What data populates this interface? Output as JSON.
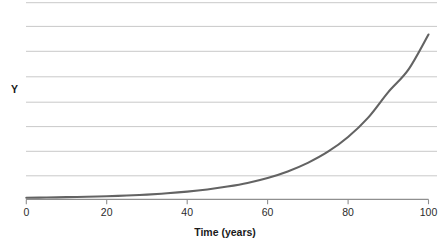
{
  "chart_data": {
    "type": "line",
    "title": "",
    "subtitle": "",
    "xlabel": "Time (years)",
    "ylabel": "Y",
    "xlim": [
      0,
      100
    ],
    "ylim": [
      0,
      9
    ],
    "grid": true,
    "grid_axis": "y",
    "legend": false,
    "legend_position": "none",
    "x_ticks": [
      0,
      20,
      40,
      60,
      80,
      100
    ],
    "x_tick_labels": [
      "0",
      "20",
      "40",
      "60",
      "80",
      "100"
    ],
    "y_ticks": [
      0,
      1,
      2,
      3,
      4,
      5,
      6,
      7,
      8,
      9
    ],
    "y_tick_labels": [
      "",
      "",
      "",
      "",
      "",
      "",
      "",
      "",
      "",
      ""
    ],
    "annotations": [],
    "series": [
      {
        "name": "Exponential growth",
        "color": "#636363",
        "line_width": 2.1,
        "x": [
          0,
          5,
          10,
          15,
          20,
          25,
          30,
          35,
          40,
          45,
          50,
          55,
          60,
          65,
          70,
          75,
          80,
          85,
          90,
          95,
          100
        ],
        "y": [
          0.05,
          0.06,
          0.08,
          0.1,
          0.13,
          0.17,
          0.22,
          0.29,
          0.38,
          0.5,
          0.66,
          0.86,
          1.13,
          1.49,
          1.96,
          2.57,
          3.38,
          4.44,
          5.84,
          7.07,
          9.0
        ]
      }
    ]
  },
  "axes": {
    "x_title": "Time (years)",
    "y_title": "Y"
  },
  "colors": {
    "curve": "#636363",
    "gridline": "#c9c9c9",
    "axis": "#808080",
    "tick_text": "#2b2b2b",
    "title_text": "#1a1a1a",
    "background": "#ffffff"
  }
}
